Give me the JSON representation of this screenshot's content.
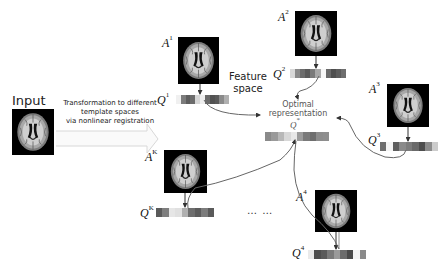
{
  "input": {
    "label": "Input"
  },
  "transform_arrow": {
    "lines": [
      "Transformation to different",
      "template spaces",
      "via nonlinear registration"
    ]
  },
  "feature_space": {
    "lines": [
      "Feature",
      "space"
    ]
  },
  "optimal": {
    "lines": [
      "Optimal",
      "representation"
    ],
    "symbol": "Q",
    "symbol_sup": "*",
    "cells": [
      "#8a8a8a",
      "#9a9a9a",
      "#b8b8b8",
      "#d8d8d8",
      "#e8e8e8",
      "#9c9c9c",
      "#7a7a7a",
      "#6e6e6e",
      "#8c8c8c",
      "#8e8e8e"
    ]
  },
  "atlases": [
    {
      "id": "1",
      "a_label": "A",
      "a_sup": "1",
      "q_label": "Q",
      "q_sup": "1",
      "cells": [
        "#f0f0f0",
        "#7c7c7c",
        "#5e5e5e",
        "#6c6c6c",
        "#d6d6d6",
        "#eeeeee",
        "#6a6a6a",
        "#525252",
        "#5a5a5a",
        "#8a8a8a",
        "#b0b0b0"
      ]
    },
    {
      "id": "2",
      "a_label": "A",
      "a_sup": "2",
      "q_label": "Q",
      "q_sup": "2",
      "cells": [
        "#d8d8d8",
        "#8a8a8a",
        "#6c6c6c",
        "#5a5a5a",
        "#7a7a7a",
        "#a8a8a8",
        "#f6f6f6",
        "#6a6a6a",
        "#4e4e4e",
        "#5c5c5c",
        "#6e6e6e"
      ]
    },
    {
      "id": "3",
      "a_label": "A",
      "a_sup": "3",
      "q_label": "Q",
      "q_sup": "3",
      "cells": [
        "#6e6e6e",
        "#f4f4f4",
        "#5e5e5e",
        "#8a8a8a",
        "#7c7c7c",
        "#6a6a6a",
        "#4e4e4e",
        "#8c8c8c",
        "#cccccc"
      ]
    },
    {
      "id": "K",
      "a_label": "A",
      "a_sup": "K",
      "q_label": "Q",
      "q_sup": "K",
      "cells": [
        "#5a5a5a",
        "#7e7e7e",
        "#e6e6e6",
        "#e0e0e0",
        "#b0b0b0",
        "#6e6e6e",
        "#5c5c5c",
        "#7c7c7c",
        "#5a5a5a"
      ]
    },
    {
      "id": "4",
      "a_label": "A",
      "a_sup": "4",
      "q_label": "Q",
      "q_sup": "4",
      "cells": [
        "#eaeaea",
        "#4e4e4e",
        "#5a5a5a",
        "#7a7a7a",
        "#9a9a9a",
        "#6c6c6c",
        "#4a4a4a",
        "#f4f4f4",
        "#8a8a8a"
      ]
    }
  ],
  "ellipsis": "… …",
  "colors": {
    "arrow": "#555555",
    "curve": "#777777",
    "brain_bg": "#000000"
  }
}
